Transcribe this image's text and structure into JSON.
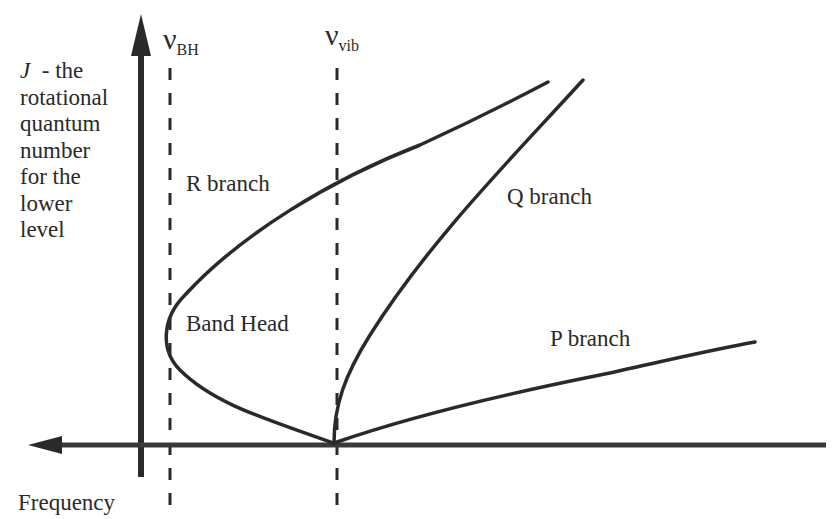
{
  "diagram": {
    "y_axis": {
      "symbol": "J",
      "label_lines": [
        "J  - the",
        "rotational",
        "quantum",
        "number",
        "for the",
        "lower",
        "level"
      ]
    },
    "x_axis": {
      "label": "Frequency",
      "arrow_direction": "left"
    },
    "markers": [
      {
        "id": "nu_bh",
        "symbol": "ν",
        "subscript": "BH",
        "meaning": "band head frequency"
      },
      {
        "id": "nu_vib",
        "symbol": "ν",
        "subscript": "vib",
        "meaning": "vibrational band origin"
      }
    ],
    "branches": [
      {
        "id": "r",
        "label": "R branch"
      },
      {
        "id": "q",
        "label": "Q branch"
      },
      {
        "id": "p",
        "label": "P branch"
      }
    ],
    "annotations": {
      "band_head": "Band Head"
    },
    "colors": {
      "ink": "#2a2a2a",
      "background": "#ffffff"
    }
  }
}
